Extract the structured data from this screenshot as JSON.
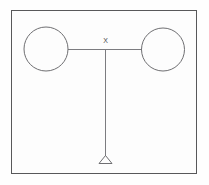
{
  "figure": {
    "background_color": "#fdfdfd",
    "frame": {
      "stroke_color": "#58585a",
      "x": 11,
      "y": 10,
      "width": 186,
      "height": 164
    },
    "labels": {
      "junction": "X"
    },
    "elements": {
      "left_mass": {
        "name": "left-mass",
        "cx": 46,
        "cy": 49,
        "r": 22,
        "stroke_color": "#6f6f72"
      },
      "right_mass": {
        "name": "right-mass",
        "cx": 163,
        "cy": 49,
        "r": 21,
        "stroke_color": "#6f6f72"
      },
      "beam": {
        "name": "horizontal-beam",
        "x1": 68,
        "y1": 49,
        "x2": 142,
        "y2": 49,
        "stroke_color": "#7c7c80"
      },
      "rod": {
        "name": "vertical-rod",
        "x1": 105,
        "y1": 49,
        "x2": 105,
        "y2": 156,
        "stroke_color": "#7c7c80"
      },
      "pivot": {
        "name": "pivot-triangle",
        "apex_x": 105,
        "apex_y": 155,
        "left_x": 98,
        "right_x": 112,
        "base_y": 164,
        "stroke_color": "#6f6f72"
      }
    }
  }
}
